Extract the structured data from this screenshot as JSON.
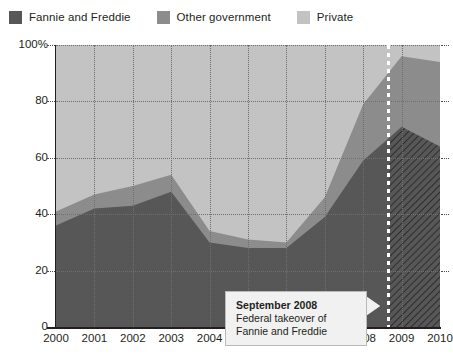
{
  "legend": {
    "items": [
      {
        "label": "Fannie and Freddie",
        "color": "#575757",
        "name": "legend-swatch-fannie-freddie"
      },
      {
        "label": "Other government",
        "color": "#8c8c8c",
        "name": "legend-swatch-other-government"
      },
      {
        "label": "Private",
        "color": "#c3c3c3",
        "name": "legend-swatch-private"
      }
    ]
  },
  "annotation": {
    "title": "September 2008",
    "line1": "Federal takeover of",
    "line2": "Fannie and Freddie"
  },
  "chart_data": {
    "type": "area",
    "stacked": true,
    "stacked_total_percent": 100,
    "title": "",
    "subtitle": "",
    "xlabel": "",
    "ylabel": "",
    "grid": true,
    "legend_position": "top-left",
    "ylim": [
      0,
      100
    ],
    "ytick_labels": [
      "0",
      "20",
      "40",
      "60",
      "80",
      "100%"
    ],
    "ytick_values": [
      0,
      20,
      40,
      60,
      80,
      100
    ],
    "xlim": [
      2000,
      2010
    ],
    "categories": [
      2000,
      2001,
      2002,
      2003,
      2004,
      2005,
      2006,
      2007,
      2008,
      2009,
      2010
    ],
    "xtick_labels": [
      "2000",
      "2001",
      "2002",
      "2003",
      "2004",
      "2005",
      "2006",
      "2007",
      "2008",
      "2009",
      "2010"
    ],
    "series": [
      {
        "name": "Fannie and Freddie",
        "color": "#575757",
        "values": [
          36,
          42,
          43,
          48,
          30,
          28,
          28,
          39,
          59,
          71,
          64
        ]
      },
      {
        "name": "Other government",
        "color": "#8c8c8c",
        "values": [
          5,
          5,
          7,
          6,
          4,
          3,
          2,
          7,
          20,
          25,
          30
        ]
      },
      {
        "name": "Private",
        "color": "#c3c3c3",
        "values": [
          59,
          53,
          50,
          46,
          66,
          69,
          70,
          54,
          21,
          4,
          6
        ]
      }
    ],
    "cumulative_band_tops": {
      "fannie_and_freddie": [
        36,
        42,
        43,
        48,
        30,
        28,
        28,
        39,
        59,
        71,
        64
      ],
      "plus_other_government": [
        41,
        47,
        50,
        54,
        34,
        31,
        30,
        46,
        79,
        96,
        94
      ]
    },
    "event_marker": {
      "label": "September 2008",
      "x_position_year": 2008.67,
      "style": "white-dashed-vertical-line"
    },
    "hatched_region": {
      "series": "Fannie and Freddie",
      "from_year": 2008.67,
      "to_year": 2010,
      "pattern": "diagonal-hatch"
    }
  }
}
